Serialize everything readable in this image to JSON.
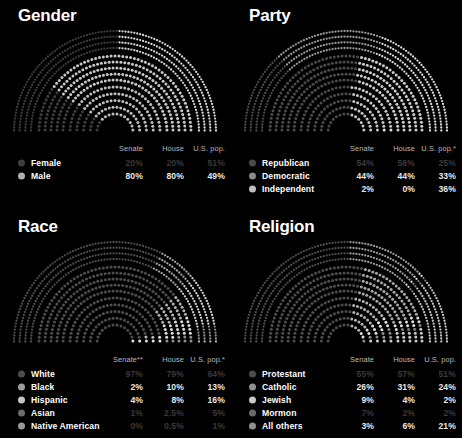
{
  "panels": [
    {
      "title": "Gender",
      "columns": [
        "Senate",
        "House",
        "U.S. pop."
      ],
      "rows": [
        {
          "label": "Female",
          "color": "#3d3d3d",
          "dim": true,
          "values": [
            "20%",
            "20%",
            "51%"
          ]
        },
        {
          "label": "Male",
          "color": "#b0b0b0",
          "dim": false,
          "values": [
            "80%",
            "80%",
            "49%"
          ]
        }
      ],
      "chart_data": {
        "type": "pie",
        "title": "Gender",
        "rings": [
          {
            "name": "U.S. pop.",
            "categories": [
              "Female",
              "Male"
            ],
            "values": [
              51,
              49
            ],
            "colors": [
              "#3d3d3d",
              "#d8d8d8"
            ]
          },
          {
            "name": "House",
            "categories": [
              "Female",
              "Male"
            ],
            "values": [
              20,
              80
            ],
            "colors": [
              "#3d3d3d",
              "#c8c8c8"
            ]
          },
          {
            "name": "Senate",
            "categories": [
              "Female",
              "Male"
            ],
            "values": [
              20,
              80
            ],
            "colors": [
              "#3d3d3d",
              "#bdbdbd"
            ]
          }
        ]
      }
    },
    {
      "title": "Party",
      "columns": [
        "Senate",
        "House",
        "U.S. pop.*"
      ],
      "rows": [
        {
          "label": "Republican",
          "color": "#4a4a4a",
          "dim": true,
          "values": [
            "54%",
            "56%",
            "25%"
          ]
        },
        {
          "label": "Democratic",
          "color": "#8a8a8a",
          "dim": false,
          "values": [
            "44%",
            "44%",
            "33%"
          ]
        },
        {
          "label": "Independent",
          "color": "#c0c0c0",
          "dim": false,
          "values": [
            "2%",
            "0%",
            "36%"
          ]
        }
      ],
      "chart_data": {
        "type": "pie",
        "title": "Party",
        "rings": [
          {
            "name": "U.S. pop.",
            "categories": [
              "Republican",
              "Democratic",
              "Independent"
            ],
            "values": [
              25,
              33,
              36
            ],
            "colors": [
              "#4a4a4a",
              "#9a9a9a",
              "#dadada"
            ]
          },
          {
            "name": "House",
            "categories": [
              "Republican",
              "Democratic",
              "Independent"
            ],
            "values": [
              56,
              44,
              0
            ],
            "colors": [
              "#4a4a4a",
              "#cdcdcd",
              "#dadada"
            ]
          },
          {
            "name": "Senate",
            "categories": [
              "Republican",
              "Democratic",
              "Independent"
            ],
            "values": [
              54,
              44,
              2
            ],
            "colors": [
              "#4a4a4a",
              "#c5c5c5",
              "#e6e6e6"
            ]
          }
        ]
      }
    },
    {
      "title": "Race",
      "columns": [
        "Senate**",
        "House",
        "U.S. pop.*"
      ],
      "rows": [
        {
          "label": "White",
          "color": "#4d4d4d",
          "dim": true,
          "values": [
            "97%",
            "79%",
            "64%"
          ]
        },
        {
          "label": "Black",
          "color": "#9c9c9c",
          "dim": false,
          "values": [
            "2%",
            "10%",
            "13%"
          ]
        },
        {
          "label": "Hispanic",
          "color": "#c6c6c6",
          "dim": false,
          "values": [
            "4%",
            "8%",
            "16%"
          ]
        },
        {
          "label": "Asian",
          "color": "#6d6d6d",
          "dim": true,
          "values": [
            "1%",
            "2.5%",
            "5%"
          ]
        },
        {
          "label": "Native American",
          "color": "#9a9a9a",
          "dim": true,
          "values": [
            "0%",
            "0.5%",
            "1%"
          ]
        }
      ],
      "chart_data": {
        "type": "pie",
        "title": "Race",
        "rings": [
          {
            "name": "U.S. pop.",
            "categories": [
              "White",
              "Black",
              "Hispanic",
              "Asian",
              "Native American"
            ],
            "values": [
              64,
              13,
              16,
              5,
              1
            ],
            "colors": [
              "#4d4d4d",
              "#a8a8a8",
              "#d5d5d5",
              "#8a8a8a",
              "#b5b5b5"
            ]
          },
          {
            "name": "House",
            "categories": [
              "White",
              "Black",
              "Hispanic",
              "Asian",
              "Native American"
            ],
            "values": [
              79,
              10,
              8,
              2.5,
              0.5
            ],
            "colors": [
              "#4d4d4d",
              "#b0b0b0",
              "#dcdcdc",
              "#909090",
              "#bbbbbb"
            ]
          },
          {
            "name": "Senate",
            "categories": [
              "White",
              "Black",
              "Hispanic",
              "Asian",
              "Native American"
            ],
            "values": [
              97,
              2,
              4,
              1,
              0
            ],
            "colors": [
              "#4d4d4d",
              "#bdbdbd",
              "#e2e2e2",
              "#9a9a9a",
              "#c0c0c0"
            ]
          }
        ]
      }
    },
    {
      "title": "Religion",
      "columns": [
        "Senate",
        "House",
        "U.S. pop."
      ],
      "rows": [
        {
          "label": "Protestant",
          "color": "#4d4d4d",
          "dim": true,
          "values": [
            "55%",
            "57%",
            "51%"
          ]
        },
        {
          "label": "Catholic",
          "color": "#909090",
          "dim": false,
          "values": [
            "26%",
            "31%",
            "24%"
          ]
        },
        {
          "label": "Jewish",
          "color": "#c8c8c8",
          "dim": false,
          "values": [
            "9%",
            "4%",
            "2%"
          ]
        },
        {
          "label": "Mormon",
          "color": "#6a6a6a",
          "dim": true,
          "values": [
            "7%",
            "2%",
            "2%"
          ]
        },
        {
          "label": "All others",
          "color": "#8e8e8e",
          "dim": false,
          "values": [
            "3%",
            "6%",
            "21%"
          ]
        }
      ],
      "chart_data": {
        "type": "pie",
        "title": "Religion",
        "rings": [
          {
            "name": "U.S. pop.",
            "categories": [
              "Protestant",
              "Catholic",
              "Jewish",
              "Mormon",
              "All others"
            ],
            "values": [
              51,
              24,
              2,
              2,
              21
            ],
            "colors": [
              "#4d4d4d",
              "#9e9e9e",
              "#dcdcdc",
              "#7a7a7a",
              "#c2c2c2"
            ]
          },
          {
            "name": "House",
            "categories": [
              "Protestant",
              "Catholic",
              "Jewish",
              "Mormon",
              "All others"
            ],
            "values": [
              57,
              31,
              4,
              2,
              6
            ],
            "colors": [
              "#4d4d4d",
              "#a8a8a8",
              "#e0e0e0",
              "#828282",
              "#c8c8c8"
            ]
          },
          {
            "name": "Senate",
            "categories": [
              "Protestant",
              "Catholic",
              "Jewish",
              "Mormon",
              "All others"
            ],
            "values": [
              55,
              26,
              9,
              7,
              3
            ],
            "colors": [
              "#4d4d4d",
              "#b2b2b2",
              "#e4e4e4",
              "#8c8c8c",
              "#cecece"
            ]
          }
        ]
      }
    }
  ]
}
